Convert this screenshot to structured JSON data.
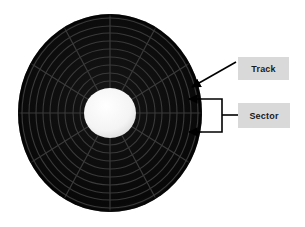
{
  "figure": {
    "background_color": "#ffffff"
  },
  "disk": {
    "name": "disk-platter",
    "center_x": 110,
    "center_y": 113,
    "outer_radius_x": 92,
    "outer_radius_y": 99,
    "platter_color": "#0b0b0b",
    "platter_edge_color": "#2a2a2a",
    "hub_color": "#f2f2f2",
    "hub_radius_x": 26,
    "hub_radius_y": 25,
    "track_count": 9,
    "sector_count": 12,
    "grid_line_color": "#3d3d3d"
  },
  "annotations": {
    "track": {
      "label": "Track",
      "box_fill": "#d9d9d9",
      "arrow_color": "#000000",
      "arrow_from_x": 236,
      "arrow_from_y": 62,
      "arrow_to_x": 190,
      "arrow_to_y": 88
    },
    "sector": {
      "label": "Sector",
      "box_fill": "#d9d9d9",
      "bracket_color": "#000000",
      "bracket_left": 202,
      "bracket_top": 99,
      "bracket_right": 222,
      "bracket_bottom": 132,
      "leader_y": 115,
      "arrow_top_to_x": 188,
      "arrow_top_to_y": 99,
      "arrow_bottom_to_x": 188,
      "arrow_bottom_to_y": 132
    }
  }
}
